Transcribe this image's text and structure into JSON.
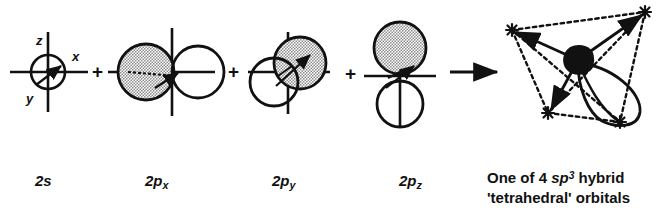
{
  "figure": {
    "background_color": "#ffffff",
    "ink_color": "#111111",
    "shaded_lobe_fill": "#b9b9b9",
    "operators": {
      "plus_1": "+",
      "plus_2": "+",
      "plus_3": "+",
      "arrow": "→"
    },
    "axes": {
      "z_label": "z",
      "x_label": "x",
      "y_label": "y"
    },
    "orbitals": [
      {
        "id": "2s",
        "label_prefix": "2",
        "label_symbol": "s",
        "label_subscript": "",
        "shape": "sphere",
        "shaded": false,
        "axes_shown": true
      },
      {
        "id": "2px",
        "label_prefix": "2",
        "label_symbol": "p",
        "label_subscript": "x",
        "shape": "two-lobe-horizontal",
        "shaded_lobe": "left",
        "axes_shown": true
      },
      {
        "id": "2py",
        "label_prefix": "2",
        "label_symbol": "p",
        "label_subscript": "y",
        "shape": "two-lobe-diagonal",
        "shaded_lobe": "upper-right",
        "axes_shown": true
      },
      {
        "id": "2pz",
        "label_prefix": "2",
        "label_symbol": "p",
        "label_subscript": "z",
        "shape": "two-lobe-vertical",
        "shaded_lobe": "top",
        "axes_shown": true
      }
    ],
    "result": {
      "caption_line_1_plain_a": "One of 4 ",
      "caption_line_1_italic": "sp",
      "caption_line_1_superscript": "3",
      "caption_line_1_plain_b": " hybrid",
      "caption_line_2": "'tetrahedral' orbitals",
      "vertex_count": 4,
      "nucleus": "filled-blob",
      "lobe": "teardrop"
    }
  }
}
